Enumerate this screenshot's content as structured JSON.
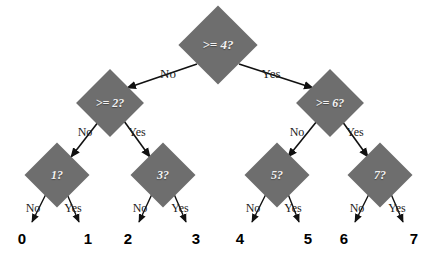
{
  "diagram": {
    "background_color": "#ffffff",
    "node_fill_color": "#6e6e6e",
    "node_text_color": "#f2f2f2",
    "edge_color": "#1c1c1c",
    "leaf_value_color": "#000000"
  },
  "nodes": [
    {
      "id": "root",
      "label": ">= 4?",
      "cx": 218,
      "cy": 45,
      "size": 56,
      "font_size": 13
    },
    {
      "id": "n2",
      "label": ">= 2?",
      "cx": 110,
      "cy": 103,
      "size": 48,
      "font_size": 12
    },
    {
      "id": "n6",
      "label": ">= 6?",
      "cx": 330,
      "cy": 103,
      "size": 48,
      "font_size": 12
    },
    {
      "id": "n1",
      "label": "1?",
      "cx": 57,
      "cy": 175,
      "size": 46,
      "font_size": 12
    },
    {
      "id": "n3",
      "label": "3?",
      "cx": 163,
      "cy": 175,
      "size": 46,
      "font_size": 12
    },
    {
      "id": "n5",
      "label": "5?",
      "cx": 277,
      "cy": 175,
      "size": 46,
      "font_size": 12
    },
    {
      "id": "n7",
      "label": "7?",
      "cx": 380,
      "cy": 175,
      "size": 46,
      "font_size": 12
    }
  ],
  "edges": [
    {
      "from": "root",
      "to": "n2",
      "label": "No",
      "lx": 168,
      "ly": 74,
      "font_size": 13,
      "x1": 197,
      "y1": 64,
      "x2": 127,
      "y2": 88
    },
    {
      "from": "root",
      "to": "n6",
      "label": "Yes",
      "lx": 271,
      "ly": 74,
      "font_size": 13,
      "x1": 239,
      "y1": 64,
      "x2": 313,
      "y2": 88
    },
    {
      "from": "n2",
      "to": "n1",
      "label": "No",
      "lx": 85,
      "ly": 132,
      "font_size": 12,
      "x1": 99,
      "y1": 121,
      "x2": 71,
      "y2": 157
    },
    {
      "from": "n2",
      "to": "n3",
      "label": "Yes",
      "lx": 137,
      "ly": 132,
      "font_size": 12,
      "x1": 124,
      "y1": 121,
      "x2": 150,
      "y2": 157
    },
    {
      "from": "n6",
      "to": "n5",
      "label": "No",
      "lx": 297,
      "ly": 132,
      "font_size": 12,
      "x1": 317,
      "y1": 121,
      "x2": 288,
      "y2": 157
    },
    {
      "from": "n6",
      "to": "n7",
      "label": "Yes",
      "lx": 355,
      "ly": 132,
      "font_size": 12,
      "x1": 342,
      "y1": 121,
      "x2": 368,
      "y2": 157
    }
  ],
  "leaf_edges": [
    {
      "from": "n1",
      "label": "No",
      "value": "0",
      "lx": 33,
      "ly": 208,
      "vx": 22,
      "vy": 238,
      "x1": 46,
      "y1": 194,
      "x2": 32,
      "y2": 222
    },
    {
      "from": "n1",
      "label": "Yes",
      "value": "1",
      "lx": 73,
      "ly": 208,
      "vx": 88,
      "vy": 238,
      "x1": 67,
      "y1": 194,
      "x2": 79,
      "y2": 222
    },
    {
      "from": "n3",
      "label": "No",
      "value": "2",
      "lx": 140,
      "ly": 208,
      "vx": 128,
      "vy": 238,
      "x1": 152,
      "y1": 194,
      "x2": 139,
      "y2": 222
    },
    {
      "from": "n3",
      "label": "Yes",
      "value": "3",
      "lx": 180,
      "ly": 208,
      "vx": 196,
      "vy": 238,
      "x1": 174,
      "y1": 194,
      "x2": 186,
      "y2": 222
    },
    {
      "from": "n5",
      "label": "No",
      "value": "4",
      "lx": 253,
      "ly": 208,
      "vx": 240,
      "vy": 238,
      "x1": 266,
      "y1": 194,
      "x2": 252,
      "y2": 222
    },
    {
      "from": "n5",
      "label": "Yes",
      "value": "5",
      "lx": 293,
      "ly": 208,
      "vx": 308,
      "vy": 238,
      "x1": 288,
      "y1": 194,
      "x2": 299,
      "y2": 222
    },
    {
      "from": "n7",
      "label": "No",
      "value": "6",
      "lx": 357,
      "ly": 208,
      "vx": 344,
      "vy": 238,
      "x1": 369,
      "y1": 194,
      "x2": 355,
      "y2": 222
    },
    {
      "from": "n7",
      "label": "Yes",
      "value": "7",
      "lx": 397,
      "ly": 208,
      "vx": 414,
      "vy": 238,
      "x1": 391,
      "y1": 194,
      "x2": 403,
      "y2": 222
    }
  ]
}
